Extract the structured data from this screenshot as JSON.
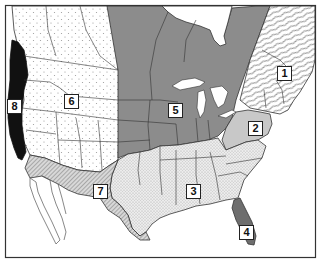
{
  "map": {
    "title": "",
    "frame": {
      "x": 5,
      "y": 5,
      "width": 311,
      "height": 253
    },
    "colors": {
      "background": "#ffffff",
      "border": "#333333",
      "region1_hatch": "#555555",
      "region2_fill": "#c8c8c8",
      "region3_fill": "#e4e4e4",
      "region4_fill": "#6e6e6e",
      "region5_fill": "#8c8c8c",
      "region6_fill": "#ffffff",
      "region7_fill": "#bdbdbd",
      "region8_fill": "#111111"
    },
    "regions": [
      {
        "id": "1",
        "label": "1",
        "name": "Northeast / Maritimes",
        "pattern": "wavy-diagonal-hatch",
        "label_x": 277,
        "label_y": 66
      },
      {
        "id": "2",
        "label": "2",
        "name": "Mid-Atlantic",
        "pattern": "light-gray-solid",
        "label_x": 248,
        "label_y": 121
      },
      {
        "id": "3",
        "label": "3",
        "name": "Southeast",
        "pattern": "fine-stipple",
        "label_x": 186,
        "label_y": 184
      },
      {
        "id": "4",
        "label": "4",
        "name": "Florida",
        "pattern": "dark-gray-solid",
        "label_x": 239,
        "label_y": 225
      },
      {
        "id": "5",
        "label": "5",
        "name": "Midwest / Central",
        "pattern": "medium-gray-solid",
        "label_x": 168,
        "label_y": 103
      },
      {
        "id": "6",
        "label": "6",
        "name": "West / Mountain",
        "pattern": "sparse-dots",
        "label_x": 64,
        "label_y": 94
      },
      {
        "id": "7",
        "label": "7",
        "name": "Southwest",
        "pattern": "diagonal-hatch",
        "label_x": 93,
        "label_y": 184
      },
      {
        "id": "8",
        "label": "8",
        "name": "Pacific Coast",
        "pattern": "black-solid",
        "label_x": 7,
        "label_y": 99
      }
    ]
  }
}
